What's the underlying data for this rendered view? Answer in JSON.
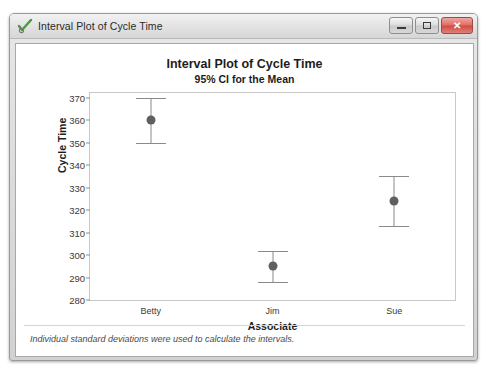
{
  "window": {
    "title": "Interval Plot of Cycle Time",
    "icon": "minitab-check-icon",
    "buttons": {
      "minimize": "minimize-button",
      "maximize": "maximize-button",
      "close": "✕"
    }
  },
  "chart_data": {
    "type": "scatter",
    "title": "Interval Plot of Cycle Time",
    "subtitle": "95% CI for the Mean",
    "xlabel": "Associate",
    "ylabel": "Cycle Time",
    "categories": [
      "Betty",
      "Jim",
      "Sue"
    ],
    "values": [
      360.0,
      295.0,
      324.0
    ],
    "ci_lower": [
      350.0,
      288.0,
      313.0
    ],
    "ci_upper": [
      370.0,
      302.0,
      335.0
    ],
    "ylim": [
      280,
      372
    ],
    "yticks": [
      280,
      290,
      300,
      310,
      320,
      330,
      340,
      350,
      360,
      370
    ],
    "ytick_labels": [
      "280",
      "290",
      "300",
      "310",
      "320",
      "330",
      "340",
      "350",
      "360",
      "370"
    ],
    "grid": false,
    "legend": "none",
    "marker_color": "#5f5f5f",
    "interval_color": "#8a8a8a",
    "footnote": "Individual standard deviations were used to calculate the intervals."
  }
}
